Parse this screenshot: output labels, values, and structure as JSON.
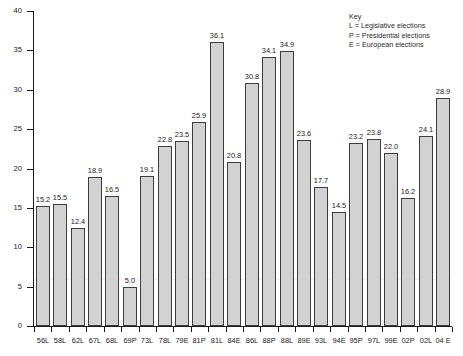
{
  "chart_data": {
    "type": "bar",
    "title": "",
    "xlabel": "",
    "ylabel": "",
    "ylim": [
      0,
      40
    ],
    "yticks": [
      0,
      5,
      10,
      15,
      20,
      25,
      30,
      35,
      40
    ],
    "grid": false,
    "legend_position": "top-right",
    "categories": [
      "56L",
      "58L",
      "62L",
      "67L",
      "68L",
      "69P",
      "73L",
      "78L",
      "79E",
      "81P",
      "81L",
      "84E",
      "86L",
      "88P",
      "88L",
      "89E",
      "93L",
      "94E",
      "95P",
      "97L",
      "99E",
      "02P",
      "02L",
      "04 E"
    ],
    "values": [
      15.2,
      15.5,
      12.4,
      18.9,
      16.5,
      5.0,
      19.1,
      22.8,
      23.5,
      25.9,
      36.1,
      20.8,
      30.8,
      34.1,
      34.9,
      23.6,
      17.7,
      14.5,
      23.2,
      23.8,
      22.0,
      16.2,
      24.1,
      28.9
    ],
    "value_labels": [
      "15.2",
      "15.5",
      "12.4",
      "18.9",
      "16.5",
      "5.0",
      "19.1",
      "22.8",
      "23.5",
      "25.9",
      "36.1",
      "20.8",
      "30.8",
      "34.1",
      "34.9",
      "23.6",
      "17.7",
      "14.5",
      "23.2",
      "23.8",
      "22.0",
      "16.2",
      "24.1",
      "28.9"
    ],
    "ytick_labels": [
      "0",
      "5",
      "10",
      "15",
      "20",
      "25",
      "30",
      "35",
      "40"
    ],
    "bar_color": "#d2d2d2",
    "bar_edge_color": "#3d3d3d"
  },
  "legend": {
    "title": "Key",
    "entries": [
      "L = Legislative elections",
      "P = Presidential elections",
      "E = European elections"
    ]
  }
}
